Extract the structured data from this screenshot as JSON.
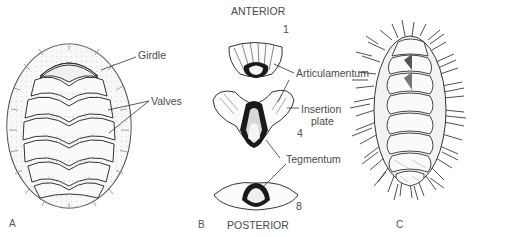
{
  "figure": {
    "panels": [
      {
        "id": "A",
        "label": "A",
        "subject": "whole chiton dorsal view"
      },
      {
        "id": "B",
        "label": "B",
        "subject": "isolated shell valves"
      },
      {
        "id": "C",
        "label": "C",
        "subject": "bristled chiton dorsal view"
      }
    ],
    "panel_a": {
      "labels": {
        "girdle": "Girdle",
        "valves": "Valves"
      },
      "valve_count": 8
    },
    "panel_b": {
      "orientation_top": "ANTERIOR",
      "orientation_bottom": "POSTERIOR",
      "valve_numbers": {
        "first": "1",
        "middle": "4",
        "last": "8"
      },
      "labels": {
        "articulamentum": "Articulamentum",
        "insertion_plate_line1": "Insertion",
        "insertion_plate_line2": "plate",
        "tegmentum": "Tegmentum"
      }
    },
    "panel_c": {
      "valve_count": 8
    },
    "colors": {
      "line": "#333333",
      "dark_fill": "#1a1a1a",
      "text": "#4a4a4a",
      "background": "#ffffff"
    }
  }
}
